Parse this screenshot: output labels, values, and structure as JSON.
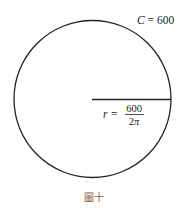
{
  "diagram": {
    "circumference_label": "C = 600",
    "circumference_var": "C",
    "circumference_value": "600",
    "radius_var": "r =",
    "radius_numerator": "600",
    "radius_denominator": "2π",
    "caption": "圖十",
    "stroke_color": "#222222"
  }
}
